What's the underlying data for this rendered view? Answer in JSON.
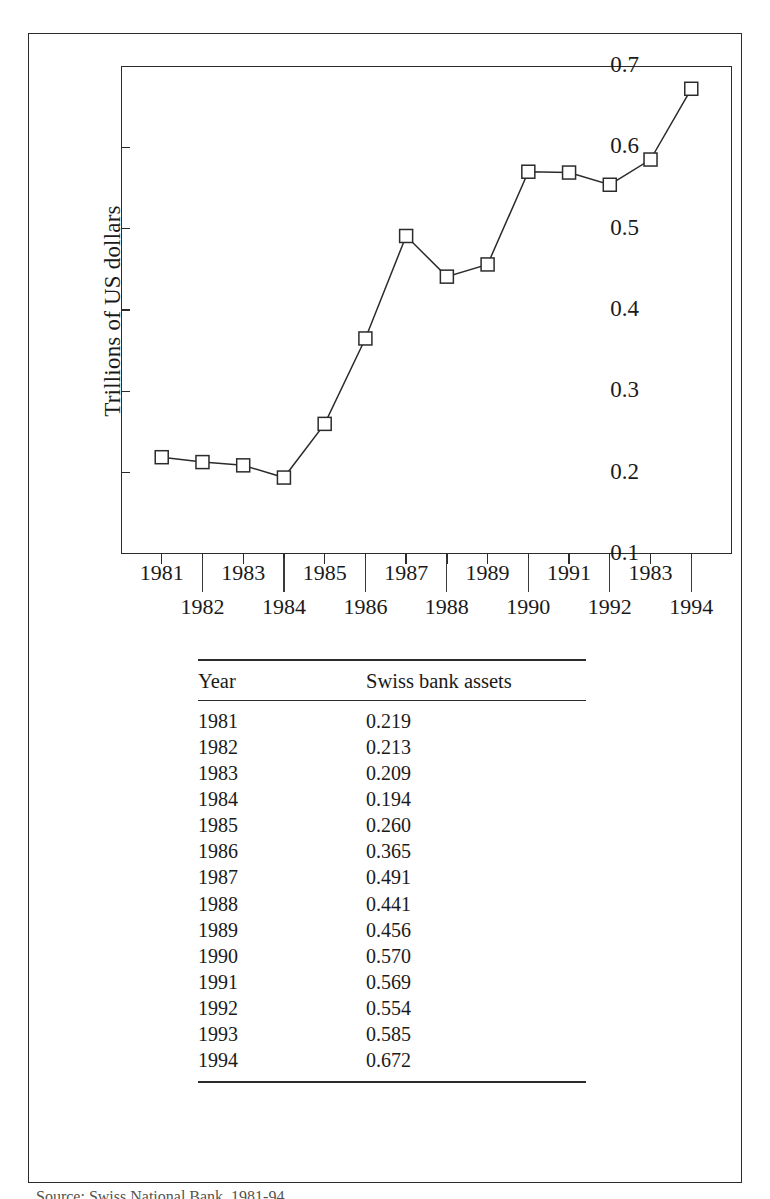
{
  "figure": {
    "caption": "Source: Swiss National Bank, 1981-94"
  },
  "chart_data": {
    "type": "line",
    "title": "",
    "xlabel": "",
    "ylabel": "Trillions of US dollars",
    "ylim": [
      0.1,
      0.7
    ],
    "ytick_labels": [
      "0.7",
      "0.6",
      "0.5",
      "0.4",
      "0.3",
      "0.2",
      "0.1"
    ],
    "ytick_values": [
      0.7,
      0.6,
      0.5,
      0.4,
      0.3,
      0.2,
      0.1
    ],
    "grid": false,
    "legend": false,
    "marker": "open-square",
    "line_color": "#2b2b2b",
    "marker_face_color": "#ffffff",
    "marker_edge_color": "#2b2b2b",
    "categories": [
      "1981",
      "1982",
      "1983",
      "1984",
      "1985",
      "1986",
      "1987",
      "1988",
      "1989",
      "1990",
      "1991",
      "1992",
      "1993",
      "1994"
    ],
    "xtick_labels_displayed": [
      "1981",
      "1982",
      "1983",
      "1984",
      "1985",
      "1986",
      "1987",
      "1988",
      "1989",
      "1990",
      "1991",
      "1992",
      "1983",
      "1994"
    ],
    "xtick_label_rows": [
      "top",
      "bottom",
      "top",
      "bottom",
      "top",
      "bottom",
      "top",
      "bottom",
      "top",
      "bottom",
      "top",
      "bottom",
      "top",
      "bottom"
    ],
    "values": [
      0.219,
      0.213,
      0.209,
      0.194,
      0.26,
      0.365,
      0.491,
      0.441,
      0.456,
      0.57,
      0.569,
      0.554,
      0.585,
      0.672
    ]
  },
  "table": {
    "columns": [
      "Year",
      "Swiss bank assets"
    ],
    "rows": [
      {
        "year": "1981",
        "value": "0.219"
      },
      {
        "year": "1982",
        "value": "0.213"
      },
      {
        "year": "1983",
        "value": "0.209"
      },
      {
        "year": "1984",
        "value": "0.194"
      },
      {
        "year": "1985",
        "value": "0.260"
      },
      {
        "year": "1986",
        "value": "0.365"
      },
      {
        "year": "1987",
        "value": "0.491"
      },
      {
        "year": "1988",
        "value": "0.441"
      },
      {
        "year": "1989",
        "value": "0.456"
      },
      {
        "year": "1990",
        "value": "0.570"
      },
      {
        "year": "1991",
        "value": "0.569"
      },
      {
        "year": "1992",
        "value": "0.554"
      },
      {
        "year": "1993",
        "value": "0.585"
      },
      {
        "year": "1994",
        "value": "0.672"
      }
    ]
  }
}
